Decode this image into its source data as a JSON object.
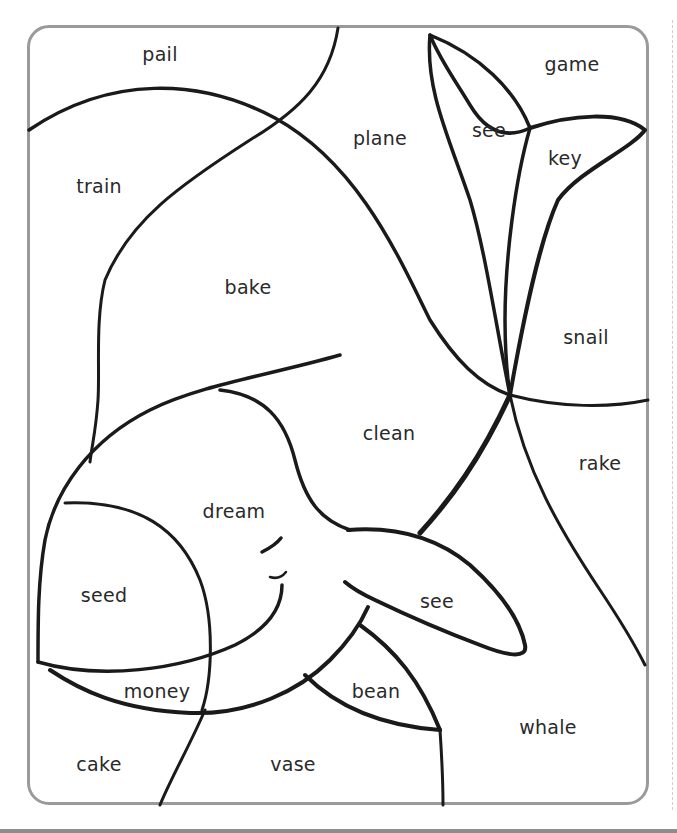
{
  "worksheet": {
    "title": "Color-by-word whale puzzle",
    "line_color": "#1a1a1a",
    "frame_color": "#9a9a9a",
    "words": [
      {
        "id": "pail",
        "text": "pail",
        "x": 160,
        "y": 54
      },
      {
        "id": "game",
        "text": "game",
        "x": 572,
        "y": 64
      },
      {
        "id": "see-tail",
        "text": "see",
        "x": 489,
        "y": 130
      },
      {
        "id": "plane",
        "text": "plane",
        "x": 380,
        "y": 138
      },
      {
        "id": "key",
        "text": "key",
        "x": 565,
        "y": 158
      },
      {
        "id": "train",
        "text": "train",
        "x": 99,
        "y": 186
      },
      {
        "id": "bake",
        "text": "bake",
        "x": 248,
        "y": 287
      },
      {
        "id": "snail",
        "text": "snail",
        "x": 586,
        "y": 337
      },
      {
        "id": "clean",
        "text": "clean",
        "x": 389,
        "y": 433
      },
      {
        "id": "rake",
        "text": "rake",
        "x": 600,
        "y": 463
      },
      {
        "id": "dream",
        "text": "dream",
        "x": 234,
        "y": 511
      },
      {
        "id": "seed",
        "text": "seed",
        "x": 104,
        "y": 595
      },
      {
        "id": "see-fin",
        "text": "see",
        "x": 437,
        "y": 601
      },
      {
        "id": "money",
        "text": "money",
        "x": 157,
        "y": 691
      },
      {
        "id": "bean",
        "text": "bean",
        "x": 376,
        "y": 691
      },
      {
        "id": "whale",
        "text": "whale",
        "x": 548,
        "y": 727
      },
      {
        "id": "cake",
        "text": "cake",
        "x": 99,
        "y": 764
      },
      {
        "id": "vase",
        "text": "vase",
        "x": 293,
        "y": 764
      }
    ]
  }
}
